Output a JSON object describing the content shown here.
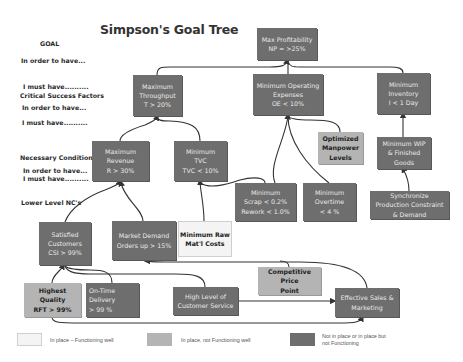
{
  "title": "Simpson's Goal Tree",
  "levels": {
    "goal": "GOAL",
    "in_order_1": "In order to have...",
    "must_1": "I must have..........",
    "csf": "Critical Success Factors",
    "in_order_2": "In order to have...",
    "must_2": "I must have..........",
    "nc": "Necessary Conditions",
    "in_order_3": "In order to have...",
    "must_3": "I must have..........",
    "lower_nc": "Lower Level NC's"
  },
  "nodes": {
    "max_profitability": {
      "text": "Max Profitability\nNP = >25%",
      "status": "not-functioning"
    },
    "max_throughput": {
      "text": "Maximum\nThroughput\nT > 20%",
      "status": "not-functioning"
    },
    "min_opex": {
      "text": "Minimum Operating\nExpenses\nOE < 10%",
      "status": "not-functioning"
    },
    "min_inventory": {
      "text": "Minimum\nInventory\nI < 1 Day",
      "status": "not-functioning"
    },
    "max_revenue": {
      "text": "Maximum\nRevenue\nR > 30%",
      "status": "not-functioning"
    },
    "min_tvc": {
      "text": "Minimum\nTVC\nTVC < 10%",
      "status": "not-functioning"
    },
    "optimized_manpower": {
      "text": "Optimized\nManpower\nLevels",
      "status": "in-place-not-functioning-well"
    },
    "min_wip": {
      "text": "Minimum WIP\n& Finished\nGoods",
      "status": "not-functioning"
    },
    "min_scrap": {
      "text": "Minimum\nScrap < 0.2%\nRework < 1.0%",
      "status": "not-functioning"
    },
    "min_overtime": {
      "text": "Minimum\nOvertime\n< 4 %",
      "status": "not-functioning"
    },
    "sync_production": {
      "text": "Synchronize\nProduction Constraint\n& Demand",
      "status": "not-functioning"
    },
    "satisfied_customers": {
      "text": "Satisfied\nCustomers\nCSI > 99%",
      "status": "not-functioning"
    },
    "market_demand": {
      "text": "Market Demand\nOrders up > 15%",
      "status": "not-functioning"
    },
    "min_raw_mat": {
      "text": "Minimum Raw\nMat'l Costs",
      "status": "functioning-well"
    },
    "highest_quality": {
      "text": "Highest Quality\nRFT > 99%",
      "status": "in-place-not-functioning-well"
    },
    "on_time_delivery": {
      "text": "On-Time\nDelivery\n> 99 %",
      "status": "not-functioning"
    },
    "customer_service": {
      "text": "High Level of\nCustomer Service",
      "status": "not-functioning"
    },
    "competitive_price": {
      "text": "Competitive Price\nPoint",
      "status": "in-place-not-functioning-well"
    },
    "sales_marketing": {
      "text": "Effective Sales &\nMarketing",
      "status": "not-functioning"
    }
  },
  "legend": [
    {
      "label": "In place – Functioning well",
      "color": "#f4f4f4"
    },
    {
      "label": "In place, not Functioning well",
      "color": "#b4b4b4"
    },
    {
      "label": "Not in place or in place but\nnot Functioning",
      "color": "#6e6e6e"
    }
  ],
  "colors": {
    "not_functioning": "#6e6e6e",
    "not_functioning_well": "#b4b4b4",
    "functioning_well": "#f4f4f4",
    "connector": "#333333"
  }
}
